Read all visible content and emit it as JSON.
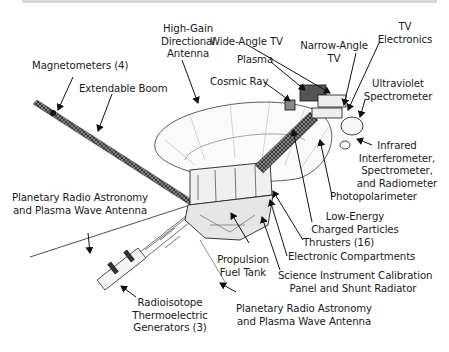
{
  "diagram": {
    "labels": {
      "high_gain": [
        "High-Gain",
        "Directional",
        "Antenna"
      ],
      "magnetometers": "Magnetometers (4)",
      "extendable_boom": "Extendable Boom",
      "wide_angle_tv": "Wide-Angle TV",
      "narrow_angle_tv": [
        "Narrow-Angle",
        "TV"
      ],
      "tv_electronics": [
        "TV",
        "Electronics"
      ],
      "plasma": "Plasma",
      "cosmic_ray": "Cosmic Ray",
      "ultraviolet": [
        "Ultraviolet",
        "Spectrometer"
      ],
      "infrared": [
        "Infrared",
        "Interferometer,",
        "Spectrometer,",
        "and Radiometer"
      ],
      "photopolarimeter": "Photopolarimeter",
      "low_energy": [
        "Low-Energy",
        "Charged Particles"
      ],
      "thrusters": "Thrusters (16)",
      "electronic_compartments": "Electronic Compartments",
      "calibration": [
        "Science Instrument Calibration",
        "Panel and Shunt Radiator"
      ],
      "pra_upper": [
        "Planetary Radio Astronomy",
        "and Plasma Wave Antenna"
      ],
      "pra_lower": [
        "Planetary Radio Astronomy",
        "and Plasma Wave Antenna"
      ],
      "propulsion": [
        "Propulsion",
        "Fuel Tank"
      ],
      "rtg": [
        "Radioisotope",
        "Thermoelectric",
        "Generators (3)"
      ]
    }
  }
}
